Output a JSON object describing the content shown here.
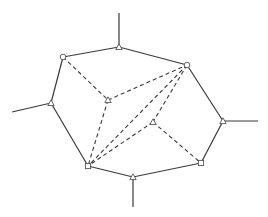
{
  "diagram": {
    "type": "planar-graph",
    "nodes": [
      {
        "id": "top",
        "x": 119,
        "y": 47,
        "marker": "triangle"
      },
      {
        "id": "upper-left",
        "x": 63,
        "y": 57,
        "marker": "circle"
      },
      {
        "id": "upper-right",
        "x": 187,
        "y": 65,
        "marker": "circle"
      },
      {
        "id": "left",
        "x": 51,
        "y": 103,
        "marker": "triangle"
      },
      {
        "id": "right",
        "x": 223,
        "y": 121,
        "marker": "triangle"
      },
      {
        "id": "inner-a",
        "x": 108,
        "y": 100,
        "marker": "triangle"
      },
      {
        "id": "inner-b",
        "x": 153,
        "y": 122,
        "marker": "triangle"
      },
      {
        "id": "lower-left",
        "x": 88,
        "y": 166,
        "marker": "square"
      },
      {
        "id": "lower-right",
        "x": 201,
        "y": 163,
        "marker": "square"
      },
      {
        "id": "bottom",
        "x": 133,
        "y": 177,
        "marker": "triangle"
      }
    ],
    "solid_edges": [
      [
        "upper-left",
        "top"
      ],
      [
        "top",
        "upper-right"
      ],
      [
        "upper-right",
        "right"
      ],
      [
        "right",
        "lower-right"
      ],
      [
        "lower-right",
        "bottom"
      ],
      [
        "bottom",
        "lower-left"
      ],
      [
        "lower-left",
        "left"
      ],
      [
        "left",
        "upper-left"
      ]
    ],
    "dashed_edges": [
      [
        "upper-left",
        "inner-a"
      ],
      [
        "inner-a",
        "upper-right"
      ],
      [
        "inner-a",
        "lower-left"
      ],
      [
        "upper-right",
        "inner-b"
      ],
      [
        "inner-b",
        "lower-left"
      ],
      [
        "inner-b",
        "lower-right"
      ],
      [
        "upper-right",
        "lower-left"
      ]
    ],
    "stubs": [
      {
        "from": "top",
        "x2": 119,
        "y2": 13
      },
      {
        "from": "left",
        "x2": 12,
        "y2": 112
      },
      {
        "from": "right",
        "x2": 258,
        "y2": 121
      },
      {
        "from": "bottom",
        "x2": 133,
        "y2": 207
      }
    ],
    "colors": {
      "line": "#3a3a3a",
      "background": "#ffffff"
    }
  }
}
